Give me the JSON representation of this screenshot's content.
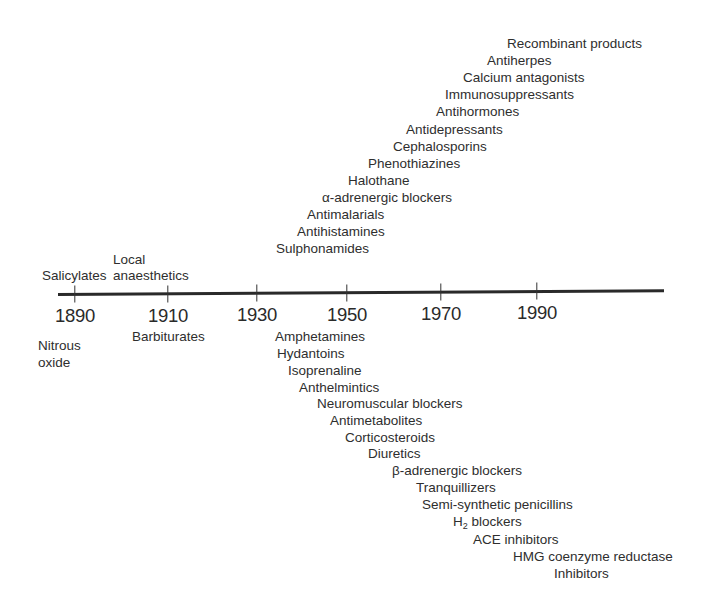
{
  "diagram": {
    "type": "timeline",
    "axis": {
      "ticks": [
        {
          "year": "1890",
          "x": 75,
          "y": 294
        },
        {
          "year": "1910",
          "x": 168,
          "y": 294
        },
        {
          "year": "1930",
          "x": 257,
          "y": 293
        },
        {
          "year": "1950",
          "x": 347,
          "y": 293
        },
        {
          "year": "1970",
          "x": 441,
          "y": 292
        },
        {
          "year": "1990",
          "x": 537,
          "y": 291
        }
      ],
      "year_labels": [
        {
          "text": "1890",
          "x": 75,
          "y": 316
        },
        {
          "text": "1910",
          "x": 168,
          "y": 316
        },
        {
          "text": "1930",
          "x": 257,
          "y": 315
        },
        {
          "text": "1950",
          "x": 347,
          "y": 315
        },
        {
          "text": "1970",
          "x": 441,
          "y": 314
        },
        {
          "text": "1990",
          "x": 537,
          "y": 313
        }
      ]
    },
    "above_axis": [
      {
        "text": "Salicylates",
        "x": 42,
        "y": 276
      },
      {
        "text": "Local",
        "x": 113,
        "y": 260
      },
      {
        "text": "anaesthetics",
        "x": 113,
        "y": 276
      },
      {
        "text": "Sulphonamides",
        "x": 276,
        "y": 249
      },
      {
        "text": "Antihistamines",
        "x": 297,
        "y": 232
      },
      {
        "text": "Antimalarials",
        "x": 307,
        "y": 215
      },
      {
        "text": "α-adrenergic blockers",
        "x": 322,
        "y": 198
      },
      {
        "text": "Halothane",
        "x": 348,
        "y": 181
      },
      {
        "text": "Phenothiazines",
        "x": 368,
        "y": 164
      },
      {
        "text": "Cephalosporins",
        "x": 393,
        "y": 147
      },
      {
        "text": "Antidepressants",
        "x": 406,
        "y": 130
      },
      {
        "text": "Antihormones",
        "x": 436,
        "y": 112
      },
      {
        "text": "Immunosuppressants",
        "x": 445,
        "y": 95
      },
      {
        "text": "Calcium antagonists",
        "x": 463,
        "y": 78
      },
      {
        "text": "Antiherpes",
        "x": 487,
        "y": 61
      },
      {
        "text": "Recombinant products",
        "x": 507,
        "y": 44
      }
    ],
    "below_axis": [
      {
        "text": "Nitrous",
        "x": 38,
        "y": 346
      },
      {
        "text": "oxide",
        "x": 38,
        "y": 363
      },
      {
        "text": "Barbiturates",
        "x": 132,
        "y": 337
      },
      {
        "text": "Amphetamines",
        "x": 275,
        "y": 337
      },
      {
        "text": "Hydantoins",
        "x": 277,
        "y": 354
      },
      {
        "text": "Isoprenaline",
        "x": 288,
        "y": 371
      },
      {
        "text": "Anthelmintics",
        "x": 299,
        "y": 388
      },
      {
        "text": "Neuromuscular blockers",
        "x": 317,
        "y": 404
      },
      {
        "text": "Antimetabolites",
        "x": 330,
        "y": 421
      },
      {
        "text": "Corticosteroids",
        "x": 345,
        "y": 438
      },
      {
        "text": "Diuretics",
        "x": 368,
        "y": 454
      },
      {
        "text": "β-adrenergic blockers",
        "x": 392,
        "y": 471
      },
      {
        "text": "Tranquillizers",
        "x": 416,
        "y": 488
      },
      {
        "text": "Semi-synthetic penicillins",
        "x": 422,
        "y": 505
      },
      {
        "text": "H",
        "sub": "2",
        "after": " blockers",
        "x": 453,
        "y": 522
      },
      {
        "text": "ACE inhibitors",
        "x": 473,
        "y": 540
      },
      {
        "text": "HMG coenzyme reductase",
        "x": 513,
        "y": 557
      },
      {
        "text": "Inhibitors",
        "x": 554,
        "y": 574
      }
    ]
  },
  "colors": {
    "background": "#ffffff",
    "ink": "#2e2e2e",
    "axis": "#2a2a2a"
  }
}
